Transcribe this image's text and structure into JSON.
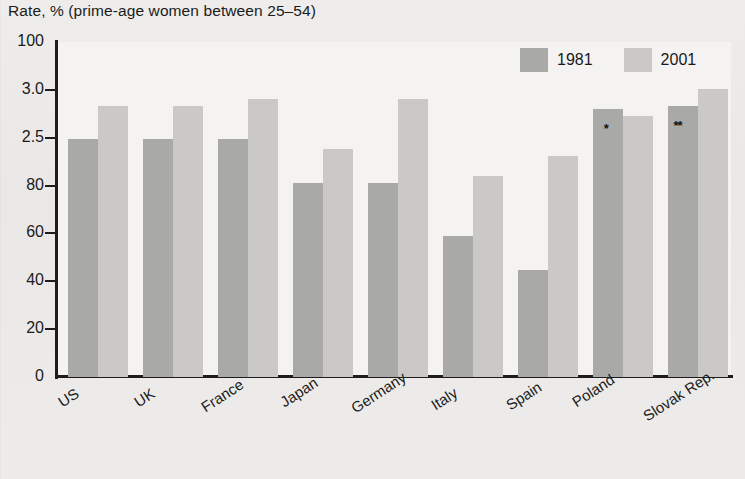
{
  "chart_data": {
    "type": "bar",
    "title": "Rate, % (prime-age women between 25–54)",
    "xlabel": "",
    "ylabel": "",
    "ylim": [
      0,
      100
    ],
    "grid": false,
    "legend_position": "top-right",
    "ytick_labels": [
      "100",
      "3.0",
      "2.5",
      "80",
      "60",
      "40",
      "20",
      "0"
    ],
    "ytick_values": [
      100,
      88.6,
      77.1,
      65.7,
      54.3,
      42.9,
      31.4,
      0
    ],
    "categories": [
      "US",
      "UK",
      "France",
      "Japan",
      "Germany",
      "Italy",
      "Spain",
      "Poland",
      "Slovak Rep."
    ],
    "series": [
      {
        "name": "1981",
        "color": "#a9a9a7",
        "values": [
          71,
          71,
          71,
          58,
          58,
          42,
          32,
          80,
          81
        ]
      },
      {
        "name": "2001",
        "color": "#cac9c6",
        "values": [
          81,
          81,
          83,
          68,
          83,
          60,
          66,
          78,
          86
        ]
      }
    ],
    "annotations": [
      {
        "text": "*",
        "category": "Poland",
        "series": "1981"
      },
      {
        "text": "**",
        "category": "Slovak Rep.",
        "series": "1981"
      }
    ]
  },
  "legend": {
    "items": [
      {
        "label": "1981",
        "color": "#a9a9a7"
      },
      {
        "label": "2001",
        "color": "#cac9c6"
      }
    ]
  },
  "colors": {
    "background": "#ecebe9",
    "plot_background": "#f4f3f1",
    "axis": "#1d1d1d",
    "series_1981": "#a9a9a7",
    "series_2001": "#cac9c6",
    "text": "#1b1b1b"
  }
}
